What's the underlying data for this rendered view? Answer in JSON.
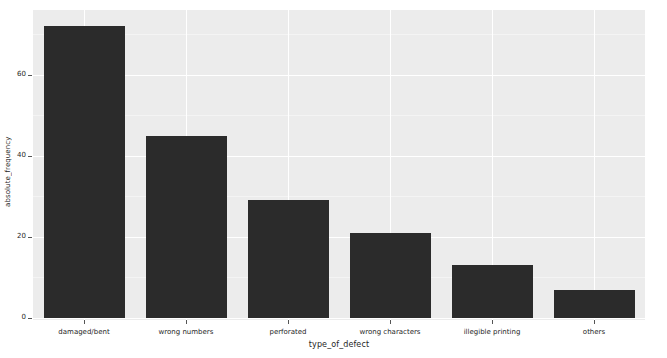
{
  "chart_data": {
    "type": "bar",
    "title": "",
    "xlabel": "type_of_defect",
    "ylabel": "absolute_frequency",
    "categories": [
      "damaged/bent",
      "wrong numbers",
      "perforated",
      "wrong characters",
      "illegible printing",
      "others"
    ],
    "values": [
      72,
      45,
      29,
      21,
      13,
      7
    ],
    "ylim": [
      0,
      76
    ],
    "yticks": [
      0,
      20,
      40,
      60
    ],
    "ytick_labels": [
      "0",
      "20",
      "40",
      "60"
    ],
    "grid": true,
    "legend": null,
    "bar_color": "#2b2b2b",
    "plot_background": "#ececec",
    "gridline_color": "#ffffff",
    "figure_background": "#ffffff"
  },
  "axes": {
    "y_title": "absolute_frequency",
    "x_title": "type_of_defect"
  }
}
